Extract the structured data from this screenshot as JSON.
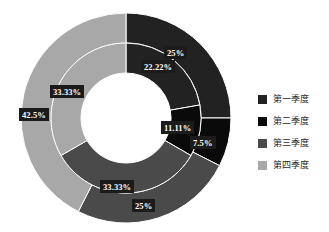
{
  "title_remnant": "",
  "chart_data": {
    "type": "pie",
    "variant": "doughnut-double-ring",
    "title": "",
    "xlabel": "",
    "ylabel": "",
    "legend_position": "right",
    "grid": false,
    "categories": [
      "第一季度",
      "第二季度",
      "第三季度",
      "第四季度"
    ],
    "colors": [
      "#222222",
      "#0a0a0a",
      "#4a4a4a",
      "#a8a8a8"
    ],
    "series": [
      {
        "name": "inner",
        "ring": "inner",
        "values": [
          22.22,
          11.11,
          33.33,
          33.33
        ],
        "labels": [
          "22.22%",
          "11.11%",
          "33.33%",
          "33.33%"
        ]
      },
      {
        "name": "outer",
        "ring": "outer",
        "values": [
          25,
          7.5,
          25,
          42.5
        ],
        "labels": [
          "25%",
          "7.5%",
          "25%",
          "42.5%"
        ]
      }
    ],
    "slice_separator_color": "#ffffff",
    "start_angle_deg": 0,
    "direction": "clockwise"
  },
  "legend": {
    "items": [
      {
        "label": "第一季度",
        "color": "#222222"
      },
      {
        "label": "第二季度",
        "color": "#0a0a0a"
      },
      {
        "label": "第三季度",
        "color": "#4a4a4a"
      },
      {
        "label": "第四季度",
        "color": "#a8a8a8"
      }
    ]
  },
  "labels": {
    "inner_q1": "22.22%",
    "inner_q2": "11.11%",
    "inner_q3": "33.33%",
    "inner_q4": "33.33%",
    "outer_q1": "25%",
    "outer_q2": "7.5%",
    "outer_q3": "25%",
    "outer_q4": "42.5%"
  }
}
